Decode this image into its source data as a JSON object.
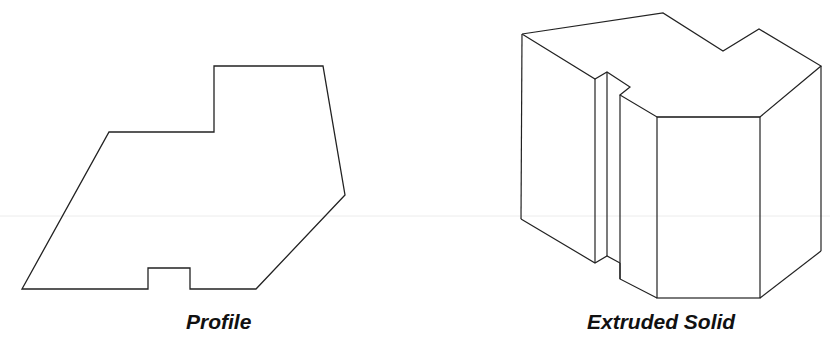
{
  "colors": {
    "background": "#ffffff",
    "line": "#222222",
    "guide": "#e6e6e6"
  },
  "profile": {
    "caption": "Profile"
  },
  "solid": {
    "caption": "Extruded Solid"
  }
}
